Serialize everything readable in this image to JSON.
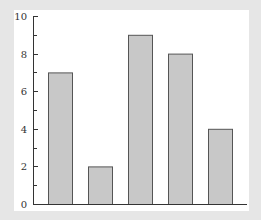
{
  "chart_data": {
    "type": "bar",
    "title": "",
    "xlabel": "",
    "ylabel": "",
    "categories": [
      "1",
      "2",
      "3",
      "4",
      "5"
    ],
    "values": [
      7,
      2,
      9,
      8,
      4
    ],
    "ylim": [
      0,
      10
    ],
    "yticks_major": [
      0,
      2,
      4,
      6,
      8,
      10
    ],
    "yticks_minor": [
      1,
      3,
      5,
      7,
      9
    ],
    "grid": false,
    "legend": null,
    "bar_color": "#c8c8c8",
    "bar_edge_color": "#555555",
    "background_color": "#e6e6e6",
    "plot_background_color": "#ffffff"
  }
}
